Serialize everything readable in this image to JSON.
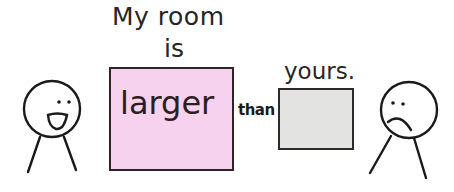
{
  "caption": {
    "line1": "My room",
    "line2": "is",
    "comparative": "larger",
    "connector": "than",
    "object": "yours."
  },
  "boxes": {
    "large": {
      "color": "#f6d2ee"
    },
    "small": {
      "color": "#e3e4e2"
    }
  },
  "figures": {
    "left": {
      "expression": "happy"
    },
    "right": {
      "expression": "sad"
    }
  }
}
